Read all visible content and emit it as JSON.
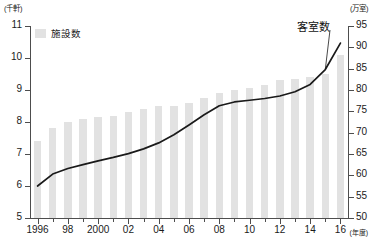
{
  "chart_data": {
    "type": "bar",
    "title": "",
    "subtitle": "",
    "xlabel": "年度",
    "categories": [
      "1996",
      "1997",
      "1998",
      "1999",
      "2000",
      "2001",
      "2002",
      "2003",
      "2004",
      "2005",
      "2006",
      "2007",
      "2008",
      "2009",
      "2010",
      "2011",
      "2012",
      "2013",
      "2014",
      "2015",
      "2016"
    ],
    "x_tick_labels": [
      "1996",
      "",
      "98",
      "",
      "2000",
      "",
      "02",
      "",
      "04",
      "",
      "06",
      "",
      "08",
      "",
      "10",
      "",
      "12",
      "",
      "14",
      "",
      "16"
    ],
    "grid": false,
    "legend_position": "top-left",
    "left_axis": {
      "label": "(千軒)",
      "unit": "千軒",
      "ylim": [
        5,
        11
      ],
      "ticks": [
        5,
        6,
        7,
        8,
        9,
        10,
        11
      ],
      "tick_labels": [
        "5",
        "6",
        "7",
        "8",
        "9",
        "10",
        "11"
      ]
    },
    "right_axis": {
      "label": "(万室)",
      "unit": "万室",
      "ylim": [
        50,
        95
      ],
      "ticks": [
        50,
        55,
        60,
        65,
        70,
        75,
        80,
        85,
        90,
        95
      ],
      "tick_labels": [
        "50",
        "55",
        "60",
        "65",
        "70",
        "75",
        "80",
        "85",
        "90",
        "95"
      ]
    },
    "series": [
      {
        "name": "施設数",
        "type": "bar",
        "axis": "left",
        "color": "#e2e2e2",
        "values": [
          7.4,
          7.8,
          8.0,
          8.1,
          8.15,
          8.2,
          8.3,
          8.4,
          8.5,
          8.5,
          8.6,
          8.75,
          8.9,
          9.0,
          9.05,
          9.15,
          9.3,
          9.35,
          9.4,
          9.5,
          10.1
        ]
      },
      {
        "name": "客室数",
        "type": "line",
        "axis": "right",
        "color": "#1a1a1a",
        "annotation": "客室数",
        "values": [
          57.5,
          60.3,
          61.6,
          62.5,
          63.4,
          64.2,
          65.1,
          66.2,
          67.6,
          69.5,
          71.8,
          74.2,
          76.3,
          77.2,
          77.6,
          78.0,
          78.6,
          79.6,
          81.3,
          84.8,
          91.0
        ]
      }
    ],
    "legend": [
      {
        "label": "施設数",
        "color": "#e2e2e2",
        "marker": "square"
      }
    ]
  },
  "axes": {
    "left_unit_caption": "(千軒)",
    "right_unit_caption": "(万室)",
    "x_unit_caption": "(年度)"
  }
}
